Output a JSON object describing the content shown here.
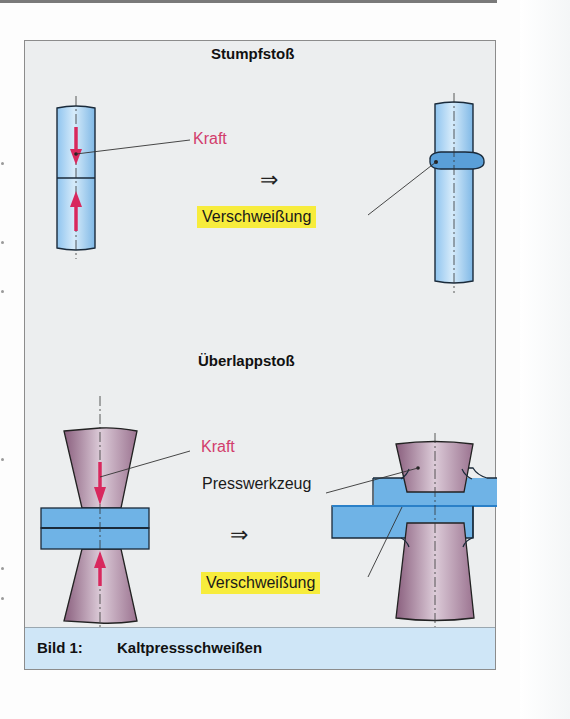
{
  "figure": {
    "caption_label": "Bild 1:",
    "caption_text": "Kaltpressschweißen",
    "butt_joint": {
      "title": "Stumpfstoß",
      "force_label": "Kraft",
      "weld_label": "Verschweißung",
      "transition_symbol": "⇒"
    },
    "lap_joint": {
      "title": "Überlappstoß",
      "force_label": "Kraft",
      "tool_label": "Presswerkzeug",
      "weld_label": "Verschweißung",
      "transition_symbol": "⇒"
    }
  },
  "colors": {
    "workpiece_blue": "#6fb3e6",
    "tool_purple": "#a7809a",
    "force_red": "#d8285e",
    "weld_highlight": "#f7ec3c",
    "caption_bg": "#cfe6f7",
    "figure_bg": "#eceeef"
  }
}
